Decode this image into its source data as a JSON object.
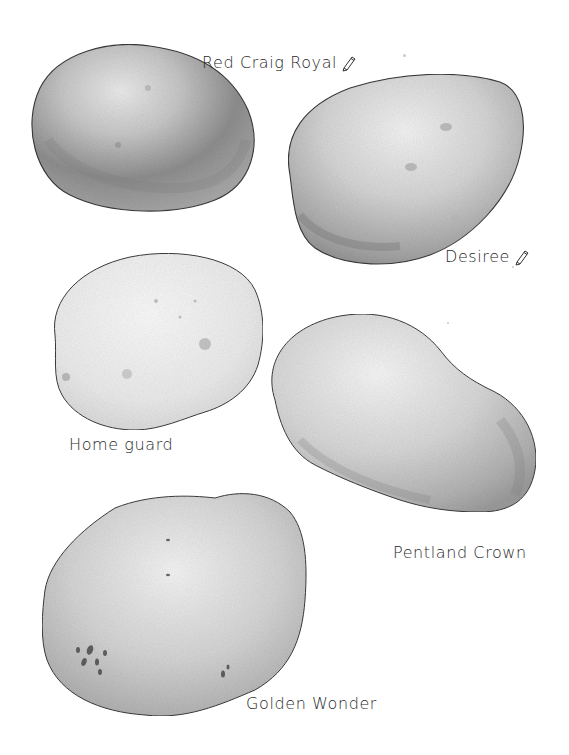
{
  "illustration": {
    "background": "#ffffff",
    "style": "pencil-shaded grayscale drawing",
    "potatoes": [
      {
        "id": "red-craig-royal",
        "label": "Red Craig Royal",
        "has_pencil_icon": true,
        "icon": "pencil-icon",
        "shade_light": "#e6e6e6",
        "shade_dark": "#8c8c8c"
      },
      {
        "id": "desiree",
        "label": "Desiree",
        "has_pencil_icon": true,
        "icon": "pencil-icon",
        "shade_light": "#ececec",
        "shade_dark": "#a3a3a3"
      },
      {
        "id": "home-guard",
        "label": "Home guard",
        "has_pencil_icon": false,
        "shade_light": "#f8f8f8",
        "shade_dark": "#d2d2d2"
      },
      {
        "id": "pentland-crown",
        "label": "Pentland Crown",
        "has_pencil_icon": false,
        "shade_light": "#f0f0f0",
        "shade_dark": "#b4b4b4"
      },
      {
        "id": "golden-wonder",
        "label": "Golden Wonder",
        "has_pencil_icon": false,
        "shade_light": "#f2f2f2",
        "shade_dark": "#a8a8a8"
      }
    ]
  }
}
